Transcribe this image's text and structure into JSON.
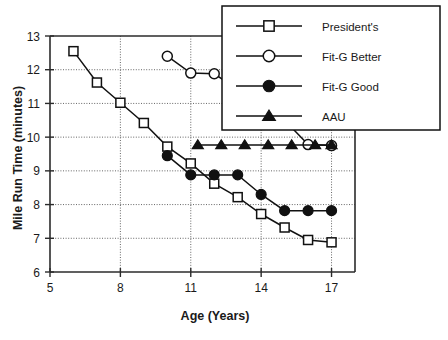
{
  "chart_data": {
    "type": "line",
    "title": "",
    "xlabel": "Age (Years)",
    "ylabel": "Mile Run Time (minutes)",
    "xlim": [
      5,
      18
    ],
    "ylim": [
      6,
      13
    ],
    "xticks": [
      5,
      8,
      11,
      14,
      17
    ],
    "yticks": [
      6,
      7,
      8,
      9,
      10,
      11,
      12,
      13
    ],
    "grid": true,
    "legend_position": "top-right",
    "series": [
      {
        "name": "President's",
        "marker": "open-square",
        "x": [
          6,
          7,
          8,
          9,
          10,
          11,
          12,
          13,
          14,
          15,
          16,
          17
        ],
        "y": [
          12.55,
          11.62,
          11.02,
          10.42,
          9.72,
          9.22,
          8.62,
          8.22,
          7.72,
          7.32,
          6.95,
          6.88
        ]
      },
      {
        "name": "Fit-G Better",
        "marker": "open-circle",
        "x": [
          10,
          11,
          12,
          13,
          14,
          15,
          16,
          17
        ],
        "y": [
          12.4,
          11.9,
          11.88,
          11.42,
          11.0,
          10.5,
          9.78,
          9.75
        ]
      },
      {
        "name": "Fit-G Good",
        "marker": "filled-circle",
        "x": [
          10,
          11,
          12,
          13,
          14,
          15,
          16,
          17
        ],
        "y": [
          9.45,
          8.88,
          8.88,
          8.88,
          8.3,
          7.82,
          7.82,
          7.82
        ]
      },
      {
        "name": "AAU",
        "marker": "filled-triangle",
        "x": [
          11.3,
          12.3,
          13.3,
          14.3,
          15.3,
          16.3,
          17.0
        ],
        "y": [
          9.77,
          9.77,
          9.77,
          9.77,
          9.77,
          9.77,
          9.77
        ]
      }
    ]
  },
  "legend": {
    "entries": [
      {
        "label": "President's",
        "marker": "open-square"
      },
      {
        "label": "Fit-G Better",
        "marker": "open-circle"
      },
      {
        "label": "Fit-G Good",
        "marker": "filled-circle"
      },
      {
        "label": "AAU",
        "marker": "filled-triangle"
      }
    ]
  },
  "axes": {
    "x_title": "Age (Years)",
    "y_title": "Mile Run Time (minutes)",
    "x_tick_labels": [
      "5",
      "8",
      "11",
      "14",
      "17"
    ],
    "y_tick_labels": [
      "6",
      "7",
      "8",
      "9",
      "10",
      "11",
      "12",
      "13"
    ]
  },
  "colors": {
    "ink": "#111111",
    "grid": "#555555",
    "background": "#ffffff"
  }
}
